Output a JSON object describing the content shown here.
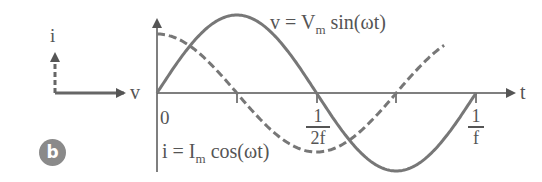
{
  "figure": {
    "badge_label": "b",
    "phasor": {
      "i_label": "i",
      "v_label": "v"
    },
    "axes": {
      "t_label": "t",
      "origin_label": "0"
    },
    "voltage_equation": {
      "lhs": "v =",
      "symbol": "V",
      "subscript": "m",
      "func": "sin(ωt)"
    },
    "current_equation": {
      "lhs": "i =",
      "symbol": "I",
      "subscript": "m",
      "func": "cos(ωt)"
    },
    "ticks": {
      "half_period": {
        "numerator": "1",
        "denominator": "2f"
      },
      "full_period": {
        "numerator": "1",
        "denominator": "f"
      }
    },
    "colors": {
      "line": "#666666",
      "badge": "#8a8a8a"
    }
  }
}
